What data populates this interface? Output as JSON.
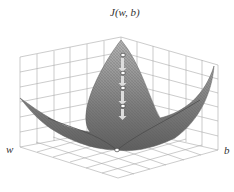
{
  "title": "J(w, b)",
  "axes": {
    "x_label": "w",
    "y_label": "b"
  },
  "colors": {
    "surface": "#8a8a8a",
    "grid": "#999999",
    "marker": "#ffffff"
  },
  "surface": {
    "type": "bowl",
    "description": "convex cost surface"
  },
  "descent_path": {
    "markers": 5,
    "arrows": 4
  }
}
